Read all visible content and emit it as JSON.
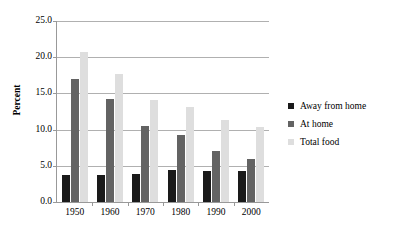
{
  "chart_data": {
    "type": "bar",
    "title": "",
    "xlabel": "",
    "ylabel": "Percent",
    "categories": [
      "1950",
      "1960",
      "1970",
      "1980",
      "1990",
      "2000"
    ],
    "series": [
      {
        "name": "Away from home",
        "color": "#1a1a1a",
        "values": [
          3.8,
          3.7,
          3.9,
          4.4,
          4.3,
          4.3
        ]
      },
      {
        "name": "At home",
        "color": "#636363",
        "values": [
          17.0,
          14.2,
          10.5,
          9.2,
          7.1,
          6.0
        ]
      },
      {
        "name": "Total food",
        "color": "#dedede",
        "values": [
          20.7,
          17.7,
          14.1,
          13.1,
          11.3,
          10.3
        ]
      }
    ],
    "ylim": [
      0.0,
      25.0
    ],
    "ytick_step": 5.0,
    "ytick_labels": [
      "0.0",
      "5.0",
      "10.0",
      "15.0",
      "20.0",
      "25.0"
    ],
    "grid": true,
    "legend_position": "right"
  }
}
